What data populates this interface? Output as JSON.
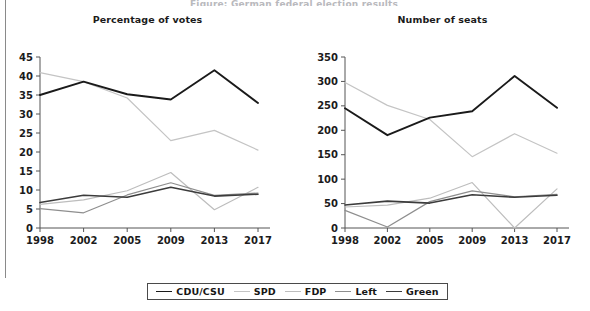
{
  "page": {
    "cropped_heading": "Figure: German federal election results",
    "border_color": "#8a8a8a"
  },
  "legend": {
    "entries": [
      {
        "label": "CDU/CSU",
        "color": "#1a1a1a",
        "width": 1.9
      },
      {
        "label": "SPD",
        "color": "#c4c4c4",
        "width": 1.5
      },
      {
        "label": "FDP",
        "color": "#bdbdbd",
        "width": 1.3
      },
      {
        "label": "Left",
        "color": "#8e8e8e",
        "width": 1.4
      },
      {
        "label": "Green",
        "color": "#3c3c3c",
        "width": 1.7
      }
    ]
  },
  "charts": [
    {
      "id": "percentage-of-votes",
      "title": "Percentage of votes"
    },
    {
      "id": "number-of-seats",
      "title": "Number of seats"
    }
  ],
  "chart_data": [
    {
      "type": "line",
      "title": "Percentage of votes",
      "xlabel": "",
      "ylabel": "",
      "categories": [
        "1998",
        "2002",
        "2005",
        "2009",
        "2013",
        "2017"
      ],
      "x": [
        1998,
        2002,
        2005,
        2009,
        2013,
        2017
      ],
      "ylim": [
        0,
        45
      ],
      "yticks": [
        0,
        5,
        10,
        15,
        20,
        25,
        30,
        35,
        40,
        45
      ],
      "grid": false,
      "legend_position": "bottom",
      "series": [
        {
          "name": "CDU/CSU",
          "color": "#1a1a1a",
          "values": [
            35.0,
            38.5,
            35.2,
            33.8,
            41.5,
            32.9
          ]
        },
        {
          "name": "SPD",
          "color": "#c4c4c4",
          "values": [
            40.9,
            38.5,
            34.2,
            23.0,
            25.7,
            20.5
          ]
        },
        {
          "name": "FDP",
          "color": "#bdbdbd",
          "values": [
            6.2,
            7.4,
            9.8,
            14.6,
            4.8,
            10.7
          ]
        },
        {
          "name": "Left",
          "color": "#8e8e8e",
          "values": [
            5.1,
            4.0,
            8.7,
            11.9,
            8.6,
            9.2
          ]
        },
        {
          "name": "Green",
          "color": "#3c3c3c",
          "values": [
            6.7,
            8.6,
            8.1,
            10.7,
            8.4,
            8.9
          ]
        }
      ]
    },
    {
      "type": "line",
      "title": "Number of seats",
      "xlabel": "",
      "ylabel": "",
      "categories": [
        "1998",
        "2002",
        "2005",
        "2009",
        "2013",
        "2017"
      ],
      "x": [
        1998,
        2002,
        2005,
        2009,
        2013,
        2017
      ],
      "ylim": [
        0,
        350
      ],
      "yticks": [
        0,
        50,
        100,
        150,
        200,
        250,
        300,
        350
      ],
      "grid": false,
      "legend_position": "bottom",
      "series": [
        {
          "name": "CDU/CSU",
          "color": "#1a1a1a",
          "values": [
            245,
            190,
            226,
            239,
            311,
            246
          ]
        },
        {
          "name": "SPD",
          "color": "#c4c4c4",
          "values": [
            298,
            251,
            222,
            146,
            193,
            153
          ]
        },
        {
          "name": "FDP",
          "color": "#bdbdbd",
          "values": [
            43,
            47,
            61,
            93,
            0,
            80
          ]
        },
        {
          "name": "Left",
          "color": "#8e8e8e",
          "values": [
            36,
            2,
            54,
            76,
            64,
            69
          ]
        },
        {
          "name": "Green",
          "color": "#3c3c3c",
          "values": [
            47,
            55,
            51,
            68,
            63,
            67
          ]
        }
      ]
    }
  ],
  "axes": {
    "tick_label_color": "#1b1b1b",
    "axis_line_color": "#555555"
  }
}
